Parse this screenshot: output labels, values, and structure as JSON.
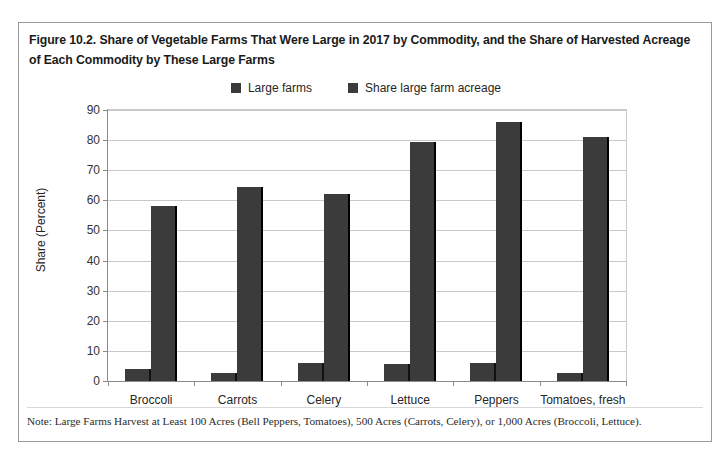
{
  "figure": {
    "title": "Figure 10.2. Share of Vegetable Farms That Were Large in 2017 by Commodity, and the Share of Harvested Acreage of Each Commodity by These Large Farms",
    "note": "Note: Large Farms Harvest at Least 100 Acres (Bell Peppers, Tomatoes), 500 Acres (Carrots, Celery), or 1,000 Acres (Broccoli, Lettuce)."
  },
  "colors": {
    "bar_fill": "#3b3b3b",
    "bar_shadow": "#000000",
    "gridline": "#c9c9c9",
    "axis": "#8a8a8a",
    "frame": "#9a9a9a",
    "text": "#262626"
  },
  "chart_data": {
    "type": "bar",
    "title": "Figure 10.2. Share of Vegetable Farms That Were Large in 2017 by Commodity, and the Share of Harvested Acreage of Each Commodity by These Large Farms",
    "xlabel": "",
    "ylabel": "Share (Percent)",
    "ylim": [
      0,
      90
    ],
    "yticks": [
      0,
      10,
      20,
      30,
      40,
      50,
      60,
      70,
      80,
      90
    ],
    "ytick_labels": [
      "0",
      "10",
      "20",
      "30",
      "40",
      "50",
      "60",
      "70",
      "80",
      "90"
    ],
    "grid": true,
    "legend_position": "top-center",
    "categories": [
      "Broccoli",
      "Carrots",
      "Celery",
      "Lettuce",
      "Peppers",
      "Tomatoes, fresh"
    ],
    "series": [
      {
        "name": "Large farms",
        "values": [
          4.0,
          2.5,
          6.0,
          5.5,
          6.0,
          2.5
        ]
      },
      {
        "name": "Share large farm acreage",
        "values": [
          58.0,
          64.5,
          62.0,
          79.5,
          86.0,
          81.0
        ]
      }
    ]
  }
}
